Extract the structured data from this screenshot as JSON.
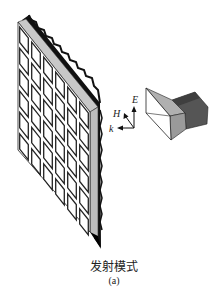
{
  "figure": {
    "title": "发射模式",
    "subtitle": "(a)",
    "array": {
      "rows": 6,
      "cols": 6,
      "element_fill": "#ffffff",
      "element_stroke": "#222222",
      "side_color": "#bdbdbd",
      "edge_color": "#111111"
    },
    "horn": {
      "aperture_color": "#ffffff",
      "flare_top_color": "#b0b0b0",
      "flare_side_color": "#9a9a9a",
      "waveguide_color": "#555555"
    },
    "axes": {
      "e_label": "E",
      "h_label": "H",
      "k_label": "k"
    }
  }
}
